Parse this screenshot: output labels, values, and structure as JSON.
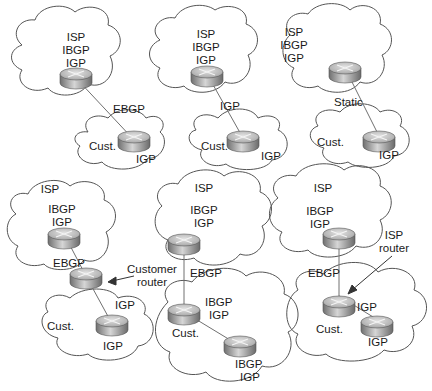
{
  "diagram": {
    "panels": [
      {
        "id": "top-left",
        "isp_cloud": {
          "lines": [
            "ISP",
            "IBGP",
            "IGP"
          ]
        },
        "link_label": "EBGP",
        "cust_cloud": {
          "label": "Cust.",
          "router_label": "IGP"
        }
      },
      {
        "id": "top-middle",
        "isp_cloud": {
          "lines": [
            "ISP",
            "IBGP",
            "IGP"
          ]
        },
        "link_label": "IGP",
        "cust_cloud": {
          "label": "Cust.",
          "router_label": "IGP"
        }
      },
      {
        "id": "top-right",
        "isp_cloud": {
          "lines": [
            "ISP",
            "IBGP",
            "IGP"
          ]
        },
        "link_label": "Static",
        "cust_cloud": {
          "label": "Cust.",
          "router_label": "IGP"
        }
      },
      {
        "id": "bottom-left",
        "isp_cloud": {
          "lines": [
            "ISP",
            "IBGP",
            "IGP"
          ]
        },
        "link_label": "EBGP",
        "annotation": {
          "lines": [
            "Customer",
            "router"
          ]
        },
        "link2_label": "IGP",
        "cust_cloud": {
          "label": "Cust.",
          "router_label": "IGP"
        }
      },
      {
        "id": "bottom-middle",
        "isp_cloud": {
          "lines": [
            "ISP",
            "IBGP",
            "IGP"
          ]
        },
        "link_label": "EBGP",
        "cust_cloud": {
          "label": "Cust.",
          "router1_lines": [
            "IBGP",
            "IGP"
          ],
          "router2_lines": [
            "IBGP",
            "IGP"
          ]
        }
      },
      {
        "id": "bottom-right",
        "isp_cloud": {
          "lines": [
            "ISP",
            "IBGP",
            "IGP"
          ]
        },
        "link_label": "EBGP",
        "annotation": {
          "lines": [
            "ISP",
            "router"
          ]
        },
        "cust_cloud": {
          "label": "Cust.",
          "router1_label": "IGP",
          "router2_label": "IGP"
        }
      }
    ]
  },
  "colors": {
    "cloud_stroke": "#555555",
    "line": "#666666",
    "router_top": "#c8c8c8",
    "router_side": "#8a8a8a"
  }
}
